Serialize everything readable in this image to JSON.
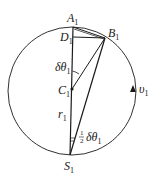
{
  "diagram": {
    "points": {
      "A": {
        "name": "A",
        "sub": "1"
      },
      "B": {
        "name": "B",
        "sub": "1"
      },
      "C": {
        "name": "C",
        "sub": "1"
      },
      "D": {
        "name": "D",
        "sub": "1"
      },
      "S": {
        "name": "S",
        "sub": "1"
      }
    },
    "labels": {
      "angle_top": {
        "text": "δθ",
        "sub": "1"
      },
      "angle_bottom": {
        "prefix_num": "1",
        "prefix_den": "2",
        "text": "δθ",
        "sub": "1"
      },
      "radius": {
        "text": "r",
        "sub": "1"
      },
      "velocity": {
        "text": "υ",
        "sub": "1"
      }
    },
    "colors": {
      "stroke": "#1a1a1a",
      "background": "#ffffff"
    }
  }
}
